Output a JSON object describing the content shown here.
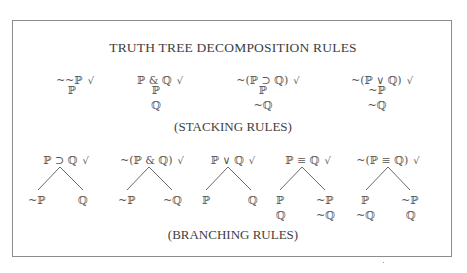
{
  "title": "TRUTH TREE DECOMPOSITION RULES",
  "stacking": {
    "label": "(STACKING RULES)",
    "rules": [
      {
        "premise": "~~ℙ",
        "check": "√",
        "results": [
          "ℙ"
        ]
      },
      {
        "premise": "ℙ & ℚ",
        "check": "√",
        "results": [
          "ℙ",
          "ℚ"
        ]
      },
      {
        "premise": "~(ℙ ⊃ ℚ)",
        "check": "√",
        "results": [
          "ℙ",
          "~ℚ"
        ]
      },
      {
        "premise": "~(ℙ ∨ ℚ)",
        "check": "√",
        "results": [
          "~ℙ",
          "~ℚ"
        ]
      }
    ]
  },
  "branching": {
    "label": "(BRANCHING RULES)",
    "rules": [
      {
        "premise": "ℙ ⊃ ℚ",
        "check": "√",
        "left": [
          "~ℙ"
        ],
        "right": [
          "ℚ"
        ]
      },
      {
        "premise": "~(ℙ & ℚ)",
        "check": "√",
        "left": [
          "~ℙ"
        ],
        "right": [
          "~ℚ"
        ]
      },
      {
        "premise": "ℙ ∨ ℚ",
        "check": "√",
        "left": [
          "ℙ"
        ],
        "right": [
          "ℚ"
        ]
      },
      {
        "premise": "ℙ ≡ ℚ",
        "check": "√",
        "left": [
          "ℙ",
          "ℚ"
        ],
        "right": [
          "~ℙ",
          "~ℚ"
        ]
      },
      {
        "premise": "~(ℙ ≡ ℚ)",
        "check": "√",
        "left": [
          "ℙ",
          "~ℚ"
        ],
        "right": [
          "~ℙ",
          "ℚ"
        ]
      }
    ]
  },
  "colors": {
    "text": "#4a4a4a",
    "border": "#8c8c8c",
    "background": "#ffffff"
  }
}
